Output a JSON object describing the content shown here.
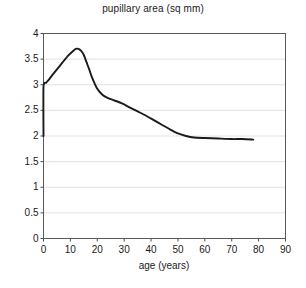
{
  "chart_data": {
    "type": "line",
    "title": "pupillary area (sq mm)",
    "xlabel": "age (years)",
    "ylabel": "",
    "xlim": [
      0,
      90
    ],
    "ylim": [
      0,
      4
    ],
    "xticks": [
      "0",
      "10",
      "20",
      "30",
      "40",
      "50",
      "60",
      "70",
      "80",
      "90"
    ],
    "yticks": [
      "0",
      "0.5",
      "1",
      "1.5",
      "2",
      "2.5",
      "3",
      "3.5",
      "4"
    ],
    "grid": "horizontal",
    "legend": "none",
    "line_color": "#1a1a1a",
    "series": [
      {
        "name": "pupillary area",
        "x": [
          0,
          0,
          1,
          2,
          3,
          5,
          7,
          9,
          11,
          12,
          13,
          14,
          15,
          16,
          17,
          18,
          20,
          22,
          24,
          26,
          29,
          32,
          35,
          38,
          41,
          44,
          47,
          50,
          53,
          56,
          60,
          65,
          70,
          74,
          78
        ],
        "y": [
          2.0,
          2.96,
          3.04,
          3.1,
          3.17,
          3.3,
          3.43,
          3.56,
          3.66,
          3.7,
          3.7,
          3.66,
          3.58,
          3.44,
          3.3,
          3.15,
          2.92,
          2.8,
          2.74,
          2.7,
          2.64,
          2.56,
          2.48,
          2.4,
          2.31,
          2.22,
          2.13,
          2.05,
          2.0,
          1.97,
          1.96,
          1.95,
          1.94,
          1.94,
          1.93
        ]
      }
    ],
    "annotations": []
  },
  "axis": {
    "title": "pupillary area (sq mm)",
    "x_axis_label": "age (years)"
  }
}
